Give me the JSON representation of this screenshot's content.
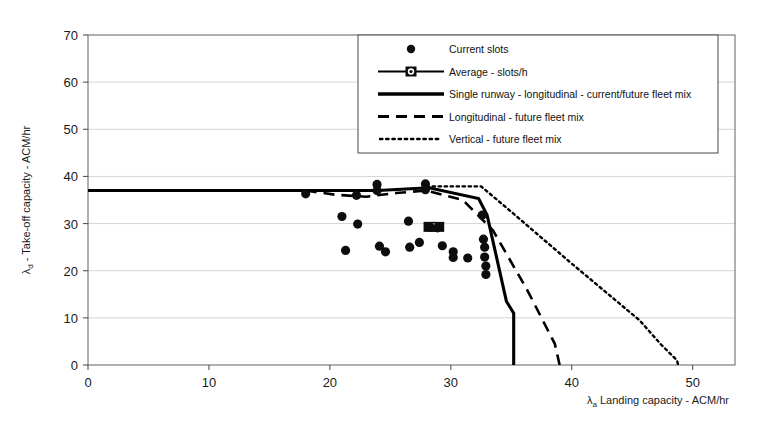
{
  "chart_data": {
    "type": "scatter",
    "title": "",
    "xlabel": "λₐ Landing capacity - ACM/hr",
    "ylabel": "λ_d - Take-off capacity - ACM/hr",
    "xlim": [
      0,
      53.5
    ],
    "ylim": [
      0,
      70
    ],
    "xticks": [
      0,
      10,
      20,
      30,
      40,
      50
    ],
    "yticks": [
      0,
      10,
      20,
      30,
      40,
      50,
      60,
      70
    ],
    "grid": "horizontal",
    "legend_position": "top-right",
    "series": [
      {
        "name": "Current slots",
        "type": "scatter",
        "marker": "circle",
        "points": [
          [
            18.0,
            36.3
          ],
          [
            21.0,
            31.5
          ],
          [
            21.3,
            24.3
          ],
          [
            22.2,
            36.0
          ],
          [
            22.3,
            29.9
          ],
          [
            23.9,
            38.3
          ],
          [
            23.9,
            37.0
          ],
          [
            24.1,
            25.2
          ],
          [
            24.6,
            24.0
          ],
          [
            26.5,
            30.5
          ],
          [
            26.6,
            25.0
          ],
          [
            27.4,
            26.0
          ],
          [
            27.9,
            38.4
          ],
          [
            27.9,
            37.2
          ],
          [
            28.3,
            29.2
          ],
          [
            28.9,
            29.1
          ],
          [
            29.3,
            25.3
          ],
          [
            30.2,
            24.0
          ],
          [
            30.2,
            22.8
          ],
          [
            31.4,
            22.7
          ],
          [
            32.6,
            31.8
          ],
          [
            32.7,
            26.7
          ],
          [
            32.8,
            25.0
          ],
          [
            32.8,
            22.9
          ],
          [
            32.9,
            21.0
          ],
          [
            32.9,
            19.2
          ]
        ]
      },
      {
        "name": "Average - slots/h",
        "type": "line",
        "marker": "square",
        "points": [
          [
            28.2,
            29.3
          ],
          [
            29.0,
            29.3
          ]
        ]
      },
      {
        "name": "Single runway - longitudinal - current/future fleet mix",
        "type": "line",
        "points": [
          [
            0,
            37.0
          ],
          [
            24.0,
            37.0
          ],
          [
            28.2,
            37.6
          ],
          [
            32.3,
            35.3
          ],
          [
            33.0,
            31.8
          ],
          [
            34.6,
            13.5
          ],
          [
            35.2,
            11.0
          ],
          [
            35.2,
            0
          ]
        ]
      },
      {
        "name": "Longitudinal - future fleet mix",
        "type": "line",
        "points": [
          [
            18.0,
            37.0
          ],
          [
            20.5,
            36.1
          ],
          [
            23.0,
            35.7
          ],
          [
            25.5,
            36.5
          ],
          [
            28.0,
            37.0
          ],
          [
            31.0,
            35.0
          ],
          [
            33.5,
            28.5
          ],
          [
            36.3,
            16.0
          ],
          [
            38.6,
            4.5
          ],
          [
            39.0,
            0
          ]
        ]
      },
      {
        "name": "Vertical - future fleet mix",
        "type": "line",
        "points": [
          [
            28.0,
            37.9
          ],
          [
            32.5,
            37.9
          ],
          [
            35.0,
            32.5
          ],
          [
            40.0,
            21.5
          ],
          [
            45.6,
            9.5
          ],
          [
            47.4,
            4.3
          ],
          [
            48.7,
            1.0
          ],
          [
            48.8,
            0
          ]
        ]
      }
    ]
  },
  "legend": {
    "entries": [
      {
        "label": "Current slots",
        "glyph": "circle-marker"
      },
      {
        "label": "Average - slots/h",
        "glyph": "line-square-marker"
      },
      {
        "label": "Single runway - longitudinal - current/future fleet mix",
        "glyph": "solid-line"
      },
      {
        "label": "Longitudinal - future fleet mix",
        "glyph": "dashed-line"
      },
      {
        "label": "Vertical - future fleet mix",
        "glyph": "dotted-line"
      }
    ]
  },
  "axes": {
    "y_label": "λ",
    "y_label_sub": "d",
    "y_label_rest": " - Take-off capacity - ACM/hr",
    "x_label": "λ",
    "x_label_sub": "a",
    "x_label_rest": " Landing capacity - ACM/hr",
    "x_tick_labels": [
      "0",
      "10",
      "20",
      "30",
      "40",
      "50"
    ],
    "y_tick_labels": [
      "0",
      "10",
      "20",
      "30",
      "40",
      "50",
      "60",
      "70"
    ]
  },
  "colors": {
    "ink": "#0d0d0d",
    "grid": "#c9c9c9",
    "frame": "#6e6e6e",
    "background": "#ffffff"
  }
}
